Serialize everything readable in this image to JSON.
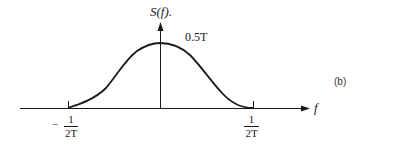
{
  "diagram": {
    "y_axis_label": "S(f).",
    "x_axis_label": "f",
    "peak_label": "0.5T",
    "left_tick": {
      "sign": "−",
      "numerator": "1",
      "denominator": "2T"
    },
    "right_tick": {
      "numerator": "1",
      "denominator": "2T"
    },
    "subfigure_label": "(b)",
    "colors": {
      "line": "#1a1a1a",
      "background": "#ffffff"
    }
  }
}
